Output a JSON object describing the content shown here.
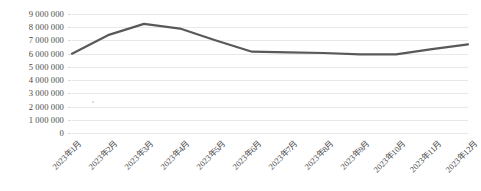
{
  "chart_data": {
    "type": "line",
    "title": "",
    "subtitle": "",
    "xlabel": "",
    "ylabel": "",
    "categories": [
      "2023年1月",
      "2023年2月",
      "2023年3月",
      "2023年4月",
      "2023年5月",
      "2023年6月",
      "2023年7月",
      "2023年8月",
      "2023年9月",
      "2023年10月",
      "2023年11月",
      "2023年12月"
    ],
    "series": [
      {
        "name": "",
        "values": [
          6000000,
          7400000,
          8250000,
          7900000,
          7000000,
          6150000,
          6100000,
          6050000,
          5950000,
          5950000,
          6350000,
          6700000
        ]
      }
    ],
    "ylim": [
      0,
      9000000
    ],
    "ytick_values": [
      0,
      1000000,
      2000000,
      3000000,
      4000000,
      5000000,
      6000000,
      7000000,
      8000000,
      9000000
    ],
    "ytick_labels": [
      "0",
      "1 000 000",
      "2 000 000",
      "3 000 000",
      "4 000 000",
      "5 000 000",
      "6 000 000",
      "7 000 000",
      "8 000 000",
      "9 000 000"
    ],
    "grid": true,
    "grid_axis": "y",
    "legend": false,
    "legend_position": "none",
    "line_color": "#595959",
    "line_width": 2.2,
    "grid_color": "#e8e8e8",
    "background_color": "#ffffff",
    "text_color": "#4a4a4a",
    "markers": false,
    "xtick_rotation": -45
  }
}
